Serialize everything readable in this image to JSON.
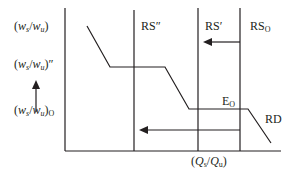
{
  "diagram": {
    "y_axis_labels": {
      "top": {
        "var1": "w",
        "sub1": "s",
        "var2": "w",
        "sub2": "u",
        "suffix": ""
      },
      "middle": {
        "var1": "w",
        "sub1": "s",
        "var2": "w",
        "sub2": "u",
        "suffix": "″"
      },
      "bottom": {
        "var1": "w",
        "sub1": "s",
        "var2": "w",
        "sub2": "u",
        "suffix_sub": "O"
      }
    },
    "x_axis_label": {
      "var1": "Q",
      "sub1": "s",
      "var2": "Q",
      "sub2": "u"
    },
    "curve_labels": {
      "rs_double_prime": "RS″",
      "rs_prime": "RS′",
      "rs_o_main": "RS",
      "rs_o_sub": "O",
      "eq_main": "E",
      "eq_sub": "O",
      "rd": "RD"
    },
    "colors": {
      "line": "#231f20",
      "background": "#ffffff"
    }
  }
}
